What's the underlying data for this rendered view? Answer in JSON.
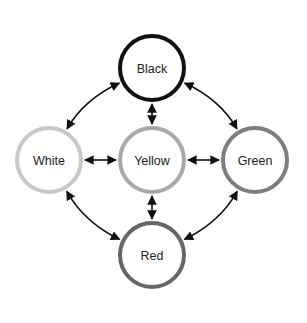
{
  "diagram": {
    "nodes": [
      {
        "id": "black",
        "label": "Black",
        "stroke": "#111111"
      },
      {
        "id": "white",
        "label": "White",
        "stroke": "#c8c8c8"
      },
      {
        "id": "yellow",
        "label": "Yellow",
        "stroke": "#a8a8a8"
      },
      {
        "id": "green",
        "label": "Green",
        "stroke": "#7e7e7e"
      },
      {
        "id": "red",
        "label": "Red",
        "stroke": "#666666"
      }
    ],
    "edges": [
      {
        "from": "black",
        "to": "white",
        "type": "bidirectional",
        "shape": "curved"
      },
      {
        "from": "black",
        "to": "green",
        "type": "bidirectional",
        "shape": "curved"
      },
      {
        "from": "black",
        "to": "yellow",
        "type": "bidirectional",
        "shape": "straight"
      },
      {
        "from": "white",
        "to": "yellow",
        "type": "bidirectional",
        "shape": "straight"
      },
      {
        "from": "yellow",
        "to": "green",
        "type": "bidirectional",
        "shape": "straight"
      },
      {
        "from": "yellow",
        "to": "red",
        "type": "bidirectional",
        "shape": "straight"
      },
      {
        "from": "white",
        "to": "red",
        "type": "bidirectional",
        "shape": "curved"
      },
      {
        "from": "green",
        "to": "red",
        "type": "bidirectional",
        "shape": "curved"
      }
    ]
  }
}
